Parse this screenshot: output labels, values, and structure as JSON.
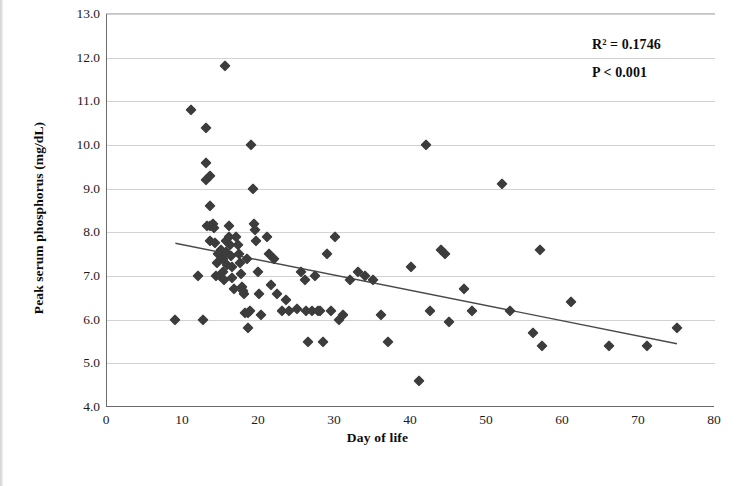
{
  "figure": {
    "background_color": "#ffffff",
    "marker_color": "#3c3c3c",
    "gridline_color": "#d2d2d2",
    "axis_color": "#6b6b6b",
    "caption_text": ""
  },
  "chart_data": {
    "type": "scatter",
    "title": "",
    "xlabel": "Day of life",
    "ylabel": "Peak serum phosphorus (mg/dL)",
    "xlim": [
      0,
      80
    ],
    "ylim": [
      4.0,
      13.0
    ],
    "xticks": [
      0,
      10,
      20,
      30,
      40,
      50,
      60,
      70,
      80
    ],
    "yticks": [
      4.0,
      5.0,
      6.0,
      7.0,
      8.0,
      9.0,
      10.0,
      11.0,
      12.0,
      13.0
    ],
    "xtick_labels": [
      "0",
      "10",
      "20",
      "30",
      "40",
      "50",
      "60",
      "70",
      "80"
    ],
    "ytick_labels": [
      "4.0",
      "5.0",
      "6.0",
      "7.0",
      "8.0",
      "9.0",
      "10.0",
      "11.0",
      "12.0",
      "13.0"
    ],
    "grid": "horizontal",
    "legend": "none",
    "annotations": [
      {
        "name": "r-squared",
        "text": "R² = 0.1746"
      },
      {
        "name": "p-value",
        "text": "P < 0.001"
      }
    ],
    "trendline": {
      "name": "linear-regression-line",
      "color": "#4a4a4a",
      "x_start": 9.0,
      "y_start": 7.75,
      "x_end": 75.0,
      "y_end": 5.45
    },
    "series": [
      {
        "name": "Peak serum phosphorus vs day of life",
        "marker": "diamond",
        "color": "#3c3c3c",
        "points": [
          [
            9,
            6.0
          ],
          [
            11,
            10.8
          ],
          [
            12,
            7.0
          ],
          [
            12.6,
            6.0
          ],
          [
            13,
            10.4
          ],
          [
            13,
            9.6
          ],
          [
            13,
            9.2
          ],
          [
            13.6,
            9.3
          ],
          [
            13.6,
            8.6
          ],
          [
            13.2,
            8.15
          ],
          [
            13.6,
            8.15
          ],
          [
            13.9,
            8.2
          ],
          [
            14.1,
            8.1
          ],
          [
            13.5,
            7.8
          ],
          [
            14.2,
            7.75
          ],
          [
            14.6,
            7.5
          ],
          [
            14.5,
            7.3
          ],
          [
            14.3,
            7.0
          ],
          [
            14.8,
            7.0
          ],
          [
            15,
            7.6
          ],
          [
            15.2,
            7.4
          ],
          [
            15.3,
            7.1
          ],
          [
            15.4,
            6.9
          ],
          [
            15.5,
            11.8
          ],
          [
            15.6,
            7.8
          ],
          [
            15.7,
            7.55
          ],
          [
            15.8,
            7.25
          ],
          [
            16,
            8.15
          ],
          [
            16.1,
            7.9
          ],
          [
            16.2,
            7.7
          ],
          [
            16.3,
            7.45
          ],
          [
            16.4,
            7.2
          ],
          [
            16.5,
            6.95
          ],
          [
            16.7,
            6.7
          ],
          [
            17,
            7.9
          ],
          [
            17.2,
            7.7
          ],
          [
            17.4,
            7.5
          ],
          [
            17.5,
            7.3
          ],
          [
            17.6,
            7.05
          ],
          [
            17.8,
            6.75
          ],
          [
            17.9,
            6.65
          ],
          [
            18,
            6.6
          ],
          [
            18.2,
            6.15
          ],
          [
            18.4,
            7.4
          ],
          [
            18.5,
            6.15
          ],
          [
            18.6,
            5.8
          ],
          [
            18.8,
            6.2
          ],
          [
            19,
            10.0
          ],
          [
            19.2,
            9.0
          ],
          [
            19.4,
            8.2
          ],
          [
            19.5,
            8.05
          ],
          [
            19.6,
            7.8
          ],
          [
            19.8,
            7.1
          ],
          [
            20,
            6.6
          ],
          [
            20.2,
            6.1
          ],
          [
            21,
            7.9
          ],
          [
            21.3,
            7.5
          ],
          [
            21.6,
            6.8
          ],
          [
            22,
            7.4
          ],
          [
            22.4,
            6.6
          ],
          [
            23,
            6.2
          ],
          [
            23.5,
            6.45
          ],
          [
            24,
            6.2
          ],
          [
            25,
            6.25
          ],
          [
            25.5,
            7.1
          ],
          [
            26,
            6.9
          ],
          [
            26.2,
            6.2
          ],
          [
            26.4,
            5.5
          ],
          [
            27,
            6.2
          ],
          [
            27.4,
            7.0
          ],
          [
            27.8,
            6.2
          ],
          [
            28,
            6.2
          ],
          [
            28.4,
            5.5
          ],
          [
            29,
            7.5
          ],
          [
            29.5,
            6.2
          ],
          [
            30,
            7.9
          ],
          [
            30.5,
            6.0
          ],
          [
            31,
            6.1
          ],
          [
            32,
            6.9
          ],
          [
            33,
            7.1
          ],
          [
            34,
            7.0
          ],
          [
            35,
            6.9
          ],
          [
            36,
            6.1
          ],
          [
            37,
            5.5
          ],
          [
            40,
            7.2
          ],
          [
            41,
            4.6
          ],
          [
            42,
            10.0
          ],
          [
            42.5,
            6.2
          ],
          [
            44,
            7.6
          ],
          [
            44.5,
            7.5
          ],
          [
            45,
            5.95
          ],
          [
            47,
            6.7
          ],
          [
            48,
            6.2
          ],
          [
            52,
            9.1
          ],
          [
            53,
            6.2
          ],
          [
            56,
            5.7
          ],
          [
            57,
            7.6
          ],
          [
            57.2,
            5.4
          ],
          [
            61,
            6.4
          ],
          [
            66,
            5.4
          ],
          [
            71,
            5.4
          ],
          [
            75,
            5.8
          ]
        ]
      }
    ]
  }
}
